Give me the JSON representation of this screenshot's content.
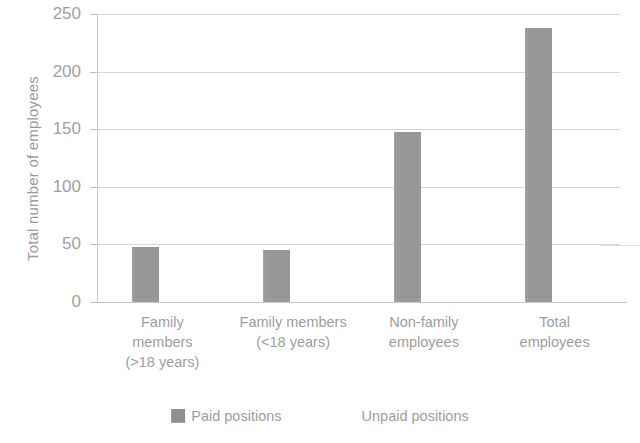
{
  "chart_data": {
    "type": "bar",
    "title": "",
    "subtitle": "",
    "xlabel": "",
    "ylabel": "Total number of employees",
    "ylim": [
      0,
      250
    ],
    "ytick_labels": [
      "250",
      "200",
      "150",
      "100",
      "50",
      "0"
    ],
    "ytick_values": [
      250,
      200,
      150,
      100,
      50,
      0
    ],
    "grid": true,
    "legend_position": "bottom",
    "categories": [
      "Family members (>18 years)",
      "Family members (<18 years)",
      "Non-family employees",
      "Total employees"
    ],
    "category_lines": [
      [
        "Family",
        "members",
        "(>18 years)"
      ],
      [
        "Family members",
        "(<18 years)"
      ],
      [
        "Non-family",
        "employees"
      ],
      [
        "Total",
        "employees"
      ]
    ],
    "series": [
      {
        "name": "Paid positions",
        "color": "#9d9d9d",
        "values": [
          48,
          45,
          148,
          238
        ]
      },
      {
        "name": "Unpaid positions",
        "color": "#ffffff",
        "values": [
          0,
          0,
          0,
          0
        ]
      }
    ]
  },
  "axis": {
    "y_title": "Total number of employees"
  },
  "legend": {
    "items": [
      {
        "label": "Paid positions",
        "swatch": "filled-gray-swatch"
      },
      {
        "label": "Unpaid positions",
        "swatch": "blank-white-swatch"
      }
    ]
  }
}
